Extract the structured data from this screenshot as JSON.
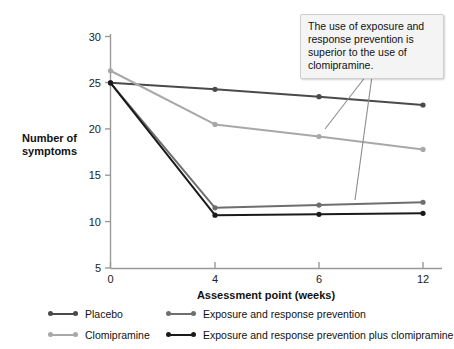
{
  "chart_data": {
    "type": "line",
    "title": "",
    "xlabel": "Assessment point (weeks)",
    "ylabel": "Number of symptoms",
    "categories": [
      "0",
      "4",
      "6",
      "12"
    ],
    "ylim": [
      5,
      30
    ],
    "yticks": [
      5,
      10,
      15,
      20,
      25,
      30
    ],
    "grid": false,
    "legend_position": "bottom",
    "series": [
      {
        "name": "Placebo",
        "color": "#4a4a4a",
        "values": [
          25.0,
          24.3,
          23.5,
          22.6
        ]
      },
      {
        "name": "Clomipramine",
        "color": "#a8a8a8",
        "values": [
          26.3,
          20.5,
          19.2,
          17.8
        ]
      },
      {
        "name": "Exposure and response prevention",
        "color": "#6e6e6e",
        "values": [
          25.0,
          11.5,
          11.8,
          12.1
        ]
      },
      {
        "name": "Exposure and response prevention plus clomipramine",
        "color": "#1a1a1a",
        "values": [
          25.0,
          10.7,
          10.8,
          10.9
        ]
      }
    ],
    "annotations": [
      {
        "name": "callout",
        "text": "The use of exposure and response prevention is superior to the use of clomipramine."
      }
    ]
  },
  "axes": {
    "y_label_line1": "Number of",
    "y_label_line2": "symptoms",
    "x_title": "Assessment point (weeks)",
    "y_ticks": [
      "30",
      "25",
      "20",
      "15",
      "10",
      "5"
    ],
    "x_ticks": [
      "0",
      "4",
      "6",
      "12"
    ],
    "axis_color": "#9a9a9a"
  },
  "callout": {
    "text": "The use of exposure and response prevention is superior to the use of clomipramine.",
    "background": "#f4f4f4",
    "border": "#cfcfcf"
  },
  "legend": {
    "items": [
      {
        "label": "Placebo",
        "color": "#4a4a4a"
      },
      {
        "label": "Exposure and response prevention",
        "color": "#6e6e6e"
      },
      {
        "label": "Clomipramine",
        "color": "#a8a8a8"
      },
      {
        "label": "Exposure and response prevention plus clomipramine",
        "color": "#1a1a1a"
      }
    ]
  }
}
